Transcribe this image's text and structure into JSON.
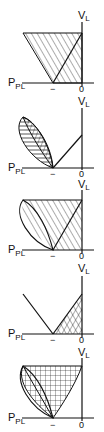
{
  "figure": {
    "axis_labels": {
      "x_axis": "P",
      "x_axis_sub": "PL",
      "y_axis": "V",
      "y_axis_sub": "L",
      "x_tick_neg": "−",
      "x_tick_zero": "0"
    },
    "colors": {
      "ink": "#111111",
      "background": "#ffffff"
    },
    "panels": [
      {
        "id": 1,
        "shading": "diagonal-hatch",
        "shape": "trapezoid"
      },
      {
        "id": 2,
        "shading": "lens-hatch",
        "shape": "lens-and-line"
      },
      {
        "id": 3,
        "shading": "diagonal-hatch-with-lens",
        "shape": "lens-and-triangle"
      },
      {
        "id": 4,
        "shading": "cross-hatch",
        "shape": "v-lines-triangle"
      },
      {
        "id": 5,
        "shading": "grid-hatch",
        "shape": "lens-and-curved-region"
      }
    ]
  }
}
